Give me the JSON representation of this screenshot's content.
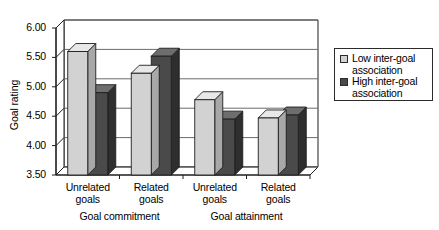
{
  "chart_data": {
    "type": "bar",
    "title": "",
    "xlabel": "",
    "ylabel": "Goal rating",
    "ylim": [
      3.5,
      6.0
    ],
    "yticks": [
      "3.50",
      "4.00",
      "4.50",
      "5.00",
      "5.50",
      "6.00"
    ],
    "ytick_values": [
      3.5,
      4.0,
      4.5,
      5.0,
      5.5,
      6.0
    ],
    "grid": true,
    "legend_position": "right",
    "style": "3d-bar",
    "categories": [
      "Unrelated goals",
      "Related goals",
      "Unrelated goals",
      "Related goals"
    ],
    "category_lines": [
      {
        "line1": "Unrelated",
        "line2": "goals"
      },
      {
        "line1": "Related",
        "line2": "goals"
      },
      {
        "line1": "Unrelated",
        "line2": "goals"
      },
      {
        "line1": "Related",
        "line2": "goals"
      }
    ],
    "groups": [
      {
        "label": "Goal commitment",
        "categories": [
          0,
          1
        ]
      },
      {
        "label": "Goal attainment",
        "categories": [
          2,
          3
        ]
      }
    ],
    "series": [
      {
        "name": "Low inter-goal association",
        "color": "#d2d2d2",
        "values": [
          5.6,
          5.23,
          4.78,
          4.47
        ]
      },
      {
        "name": "High inter-goal association",
        "color": "#4a4a4a",
        "values": [
          4.9,
          5.52,
          4.45,
          4.52
        ]
      }
    ]
  },
  "legend": {
    "items": [
      {
        "line1": "Low inter-goal",
        "line2": "association",
        "color": "#d2d2d2"
      },
      {
        "line1": "High inter-goal",
        "line2": "association",
        "color": "#4a4a4a"
      }
    ]
  },
  "colors": {
    "light_bar": "#d2d2d2",
    "light_bar_top": "#e8e8e8",
    "light_bar_side": "#a8a8a8",
    "dark_bar": "#4a4a4a",
    "dark_bar_top": "#6e6e6e",
    "dark_bar_side": "#2e2e2e",
    "axis": "#1e1e1e",
    "grid": "#6b6b6b",
    "background": "#ffffff"
  }
}
